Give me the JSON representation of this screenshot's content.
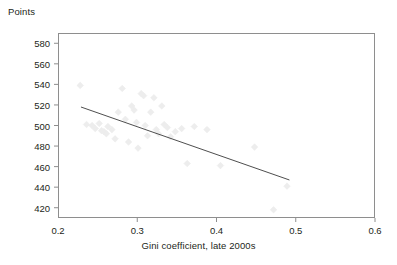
{
  "chart_data": {
    "type": "scatter",
    "title": "",
    "xlabel": "Gini coefficient, late 2000s",
    "ylabel": "Points",
    "xlim": [
      0.2,
      0.6
    ],
    "ylim": [
      410,
      590
    ],
    "xticks": [
      0.2,
      0.3,
      0.4,
      0.5,
      0.6
    ],
    "xtick_labels": [
      "0.2",
      "0.3",
      "0.4",
      "0.5",
      "0.6"
    ],
    "yticks": [
      420,
      440,
      460,
      480,
      500,
      520,
      540,
      560,
      580
    ],
    "ytick_labels": [
      "420",
      "440",
      "460",
      "480",
      "500",
      "520",
      "540",
      "560",
      "580"
    ],
    "grid": false,
    "legend": false,
    "marker": "diamond",
    "marker_color": "#ededed",
    "marker_size": 5,
    "points": [
      {
        "x": 0.228,
        "y": 539
      },
      {
        "x": 0.236,
        "y": 501
      },
      {
        "x": 0.243,
        "y": 500
      },
      {
        "x": 0.247,
        "y": 497
      },
      {
        "x": 0.252,
        "y": 502
      },
      {
        "x": 0.255,
        "y": 495
      },
      {
        "x": 0.258,
        "y": 494
      },
      {
        "x": 0.261,
        "y": 492
      },
      {
        "x": 0.263,
        "y": 499
      },
      {
        "x": 0.268,
        "y": 496
      },
      {
        "x": 0.272,
        "y": 487
      },
      {
        "x": 0.276,
        "y": 513
      },
      {
        "x": 0.281,
        "y": 536
      },
      {
        "x": 0.285,
        "y": 506
      },
      {
        "x": 0.289,
        "y": 484
      },
      {
        "x": 0.293,
        "y": 519
      },
      {
        "x": 0.296,
        "y": 515
      },
      {
        "x": 0.299,
        "y": 503
      },
      {
        "x": 0.301,
        "y": 478
      },
      {
        "x": 0.305,
        "y": 531
      },
      {
        "x": 0.308,
        "y": 529
      },
      {
        "x": 0.31,
        "y": 500
      },
      {
        "x": 0.313,
        "y": 490
      },
      {
        "x": 0.317,
        "y": 513
      },
      {
        "x": 0.321,
        "y": 527
      },
      {
        "x": 0.324,
        "y": 496
      },
      {
        "x": 0.327,
        "y": 492
      },
      {
        "x": 0.331,
        "y": 519
      },
      {
        "x": 0.334,
        "y": 501
      },
      {
        "x": 0.338,
        "y": 498
      },
      {
        "x": 0.342,
        "y": 489
      },
      {
        "x": 0.348,
        "y": 494
      },
      {
        "x": 0.356,
        "y": 497
      },
      {
        "x": 0.363,
        "y": 463
      },
      {
        "x": 0.372,
        "y": 499
      },
      {
        "x": 0.388,
        "y": 496
      },
      {
        "x": 0.405,
        "y": 461
      },
      {
        "x": 0.448,
        "y": 479
      },
      {
        "x": 0.472,
        "y": 418
      },
      {
        "x": 0.489,
        "y": 441
      }
    ],
    "trendline": {
      "color": "#3a3a3a",
      "x_start": 0.229,
      "y_start": 518,
      "x_end": 0.492,
      "y_end": 447
    }
  }
}
